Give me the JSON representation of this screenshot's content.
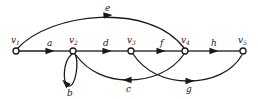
{
  "diagram": {
    "type": "signal-flow-graph",
    "nodes": [
      {
        "id": "v1",
        "label": "v",
        "sub": "1"
      },
      {
        "id": "v2",
        "label": "v",
        "sub": "2"
      },
      {
        "id": "v3",
        "label": "v",
        "sub": "3"
      },
      {
        "id": "v4",
        "label": "v",
        "sub": "4"
      },
      {
        "id": "v5",
        "label": "v",
        "sub": "5"
      }
    ],
    "edges": [
      {
        "from": "v1",
        "to": "v2",
        "label": "a"
      },
      {
        "from": "v2",
        "to": "v2",
        "label": "b"
      },
      {
        "from": "v4",
        "to": "v2",
        "label": "c"
      },
      {
        "from": "v2",
        "to": "v3",
        "label": "d"
      },
      {
        "from": "v1",
        "to": "v4",
        "label": "e"
      },
      {
        "from": "v3",
        "to": "v4",
        "label": "f"
      },
      {
        "from": "v3",
        "to": "v5",
        "label": "g"
      },
      {
        "from": "v4",
        "to": "v5",
        "label": "h"
      }
    ]
  }
}
